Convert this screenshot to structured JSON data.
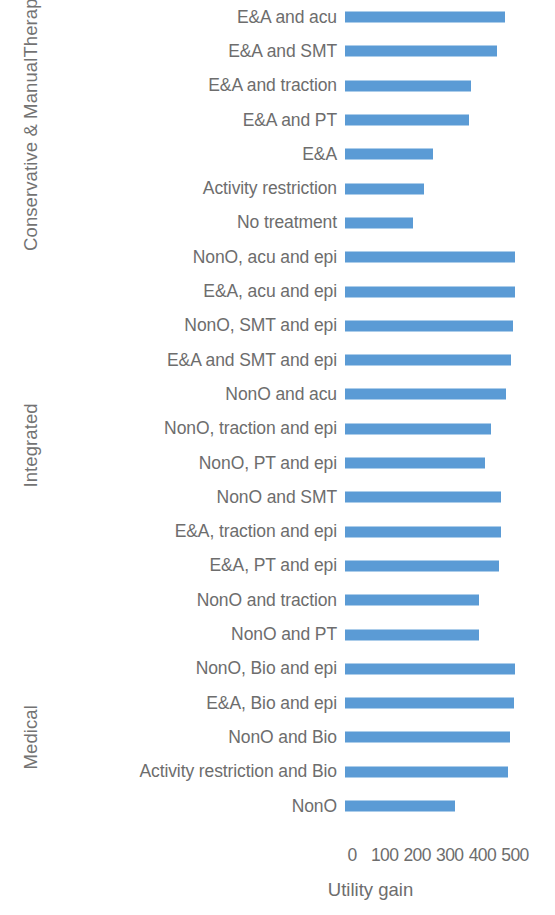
{
  "chart_data": {
    "type": "bar",
    "orientation": "horizontal",
    "title": "",
    "xlabel": "Utility gain",
    "ylabel": "",
    "xlim": [
      0,
      500
    ],
    "xticks": [
      0,
      100,
      200,
      300,
      400,
      500
    ],
    "xtick_labels": [
      "0",
      "100",
      "200",
      "300",
      "400",
      "500"
    ],
    "grid": false,
    "legend": false,
    "bar_color": "#5B9BD5",
    "text_color": "#6d6d6d",
    "group_axis_label": "",
    "groups": [
      {
        "name": "Conservative & Manual Therapy",
        "label_lines": [
          "Conservative & Manual",
          "Therapy"
        ]
      },
      {
        "name": "Integrated",
        "label_lines": [
          "Integrated"
        ]
      },
      {
        "name": "Medical",
        "label_lines": [
          "Medical"
        ]
      }
    ],
    "categories": [
      "E&A and acu",
      "E&A and SMT",
      "E&A and traction",
      "E&A and PT",
      "E&A",
      "Activity restriction",
      "No treatment",
      "NonO, acu and epi",
      "E&A, acu and epi",
      "NonO, SMT and epi",
      "E&A and SMT and epi",
      "NonO and acu",
      "NonO, traction and epi",
      "NonO, PT and epi",
      "NonO and SMT",
      "E&A, traction and epi",
      "E&A, PT and epi",
      "NonO and traction",
      "NonO and PT",
      "NonO, Bio and epi",
      "E&A, Bio and epi",
      "NonO and Bio",
      "Activity restriction and Bio",
      "NonO"
    ],
    "values": [
      490,
      465,
      385,
      380,
      270,
      242,
      208,
      520,
      520,
      515,
      510,
      495,
      447,
      430,
      480,
      478,
      472,
      410,
      410,
      523,
      518,
      505,
      500,
      338
    ],
    "group_spans": [
      {
        "group": "Conservative & Manual Therapy",
        "start": 0,
        "end": 6
      },
      {
        "group": "Integrated",
        "start": 7,
        "end": 18
      },
      {
        "group": "Medical",
        "start": 19,
        "end": 23
      }
    ]
  }
}
